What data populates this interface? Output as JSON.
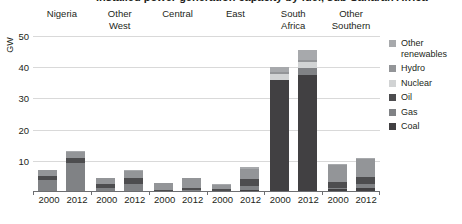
{
  "title": "Installed power generation capacity by fuel, sub-Saharan Africa",
  "axis": {
    "y_title": "GW",
    "y_ticks": [
      "10",
      "20",
      "30",
      "40",
      "50"
    ]
  },
  "legend": {
    "items": [
      {
        "label": "Other renewables",
        "color": "#a7a9ac"
      },
      {
        "label": "Hydro",
        "color": "#939598"
      },
      {
        "label": "Nuclear",
        "color": "#d1d3d4"
      },
      {
        "label": "Oil",
        "color": "#4d4d4f"
      },
      {
        "label": "Gas",
        "color": "#808285"
      },
      {
        "label": "Coal",
        "color": "#414042"
      }
    ]
  },
  "chart_data": {
    "type": "bar",
    "title": "Installed power generation capacity by fuel, sub-Saharan Africa",
    "xlabel": "",
    "ylabel": "GW",
    "ylim": [
      0,
      50
    ],
    "grid": true,
    "stacked": true,
    "legend_position": "right",
    "groups": [
      "Nigeria",
      "Other West",
      "Central",
      "East",
      "South Africa",
      "Other Southern"
    ],
    "categories": [
      "Nigeria 2000",
      "Nigeria 2012",
      "Other West 2000",
      "Other West 2012",
      "Central 2000",
      "Central 2012",
      "East 2000",
      "East 2012",
      "South Africa 2000",
      "South Africa 2012",
      "Other Southern 2000",
      "Other Southern 2012"
    ],
    "series": [
      {
        "name": "Coal",
        "color": "#414042",
        "values": [
          0.0,
          0.0,
          0.2,
          0.3,
          0.0,
          0.0,
          0.0,
          0.6,
          36.0,
          37.5,
          1.0,
          1.2
        ]
      },
      {
        "name": "Gas",
        "color": "#808285",
        "values": [
          4.0,
          9.2,
          1.2,
          2.3,
          0.3,
          0.5,
          0.2,
          1.4,
          0.0,
          2.4,
          0.3,
          1.4
        ]
      },
      {
        "name": "Oil",
        "color": "#4d4d4f",
        "values": [
          1.2,
          1.6,
          1.2,
          2.0,
          0.4,
          0.7,
          0.9,
          2.2,
          0.0,
          0.0,
          1.8,
          2.2
        ]
      },
      {
        "name": "Nuclear",
        "color": "#d1d3d4",
        "values": [
          0.0,
          0.0,
          0.0,
          0.0,
          0.0,
          0.0,
          0.0,
          0.0,
          1.8,
          1.8,
          0.0,
          0.0
        ]
      },
      {
        "name": "Hydro",
        "color": "#939598",
        "values": [
          1.9,
          2.0,
          1.8,
          2.2,
          2.3,
          3.2,
          1.3,
          3.2,
          0.7,
          0.7,
          5.6,
          5.8
        ]
      },
      {
        "name": "Other renewables",
        "color": "#a7a9ac",
        "values": [
          0.0,
          0.2,
          0.1,
          0.2,
          0.0,
          0.1,
          0.1,
          0.6,
          1.5,
          3.1,
          0.3,
          0.4
        ]
      }
    ],
    "group_totals": [
      7.1,
      13.0,
      4.5,
      7.0,
      3.0,
      4.5,
      2.5,
      8.0,
      40.0,
      45.5,
      9.0,
      11.0
    ],
    "x_tick_labels": [
      "2000",
      "2012"
    ]
  }
}
